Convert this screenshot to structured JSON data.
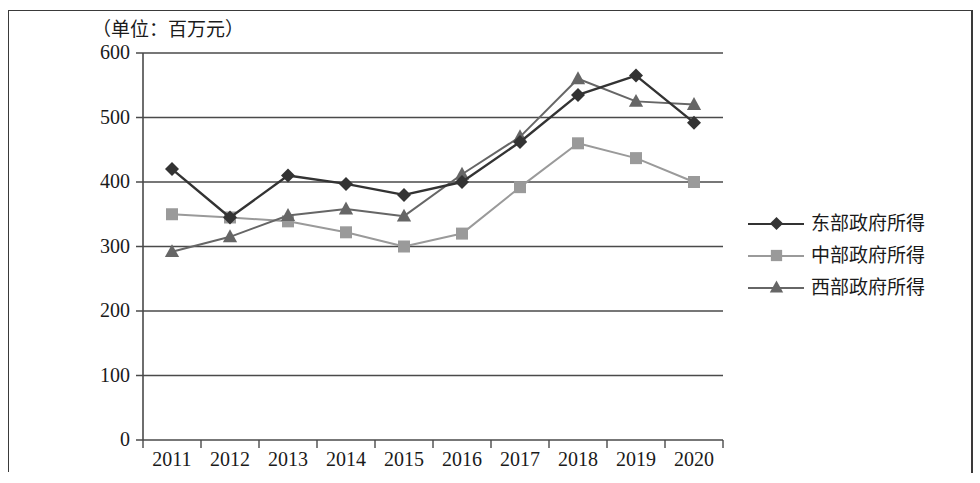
{
  "unit_label": "（单位：百万元）",
  "legend": {
    "items": [
      {
        "label": "东部政府所得",
        "marker": "diamond",
        "color": "#333333"
      },
      {
        "label": "中部政府所得",
        "marker": "square",
        "color": "#9a9a9a"
      },
      {
        "label": "西部政府所得",
        "marker": "triangle",
        "color": "#666666"
      }
    ]
  },
  "chart_data": {
    "type": "line",
    "title": "",
    "subtitle": "",
    "xlabel": "",
    "ylabel": "（单位：百万元）",
    "categories": [
      "2011",
      "2012",
      "2013",
      "2014",
      "2015",
      "2016",
      "2017",
      "2018",
      "2019",
      "2020"
    ],
    "x_tick_labels": [
      "2011",
      "2012",
      "2013",
      "2014",
      "2015",
      "2016",
      "2017",
      "2018",
      "2019",
      "2020"
    ],
    "y_tick_labels": [
      "0",
      "100",
      "200",
      "300",
      "400",
      "500",
      "600"
    ],
    "ylim": [
      0,
      600
    ],
    "y_step": 100,
    "grid": "horizontal",
    "legend_position": "right",
    "series": [
      {
        "name": "东部政府所得",
        "marker": "diamond",
        "color": "#333333",
        "values": [
          420,
          345,
          410,
          397,
          380,
          400,
          462,
          535,
          565,
          492
        ]
      },
      {
        "name": "中部政府所得",
        "marker": "square",
        "color": "#9a9a9a",
        "values": [
          350,
          345,
          339,
          322,
          300,
          320,
          392,
          460,
          437,
          400
        ]
      },
      {
        "name": "西部政府所得",
        "marker": "triangle",
        "color": "#666666",
        "values": [
          292,
          315,
          348,
          358,
          347,
          412,
          470,
          560,
          525,
          520
        ]
      }
    ]
  }
}
